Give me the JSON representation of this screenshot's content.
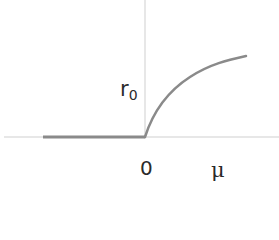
{
  "diagram": {
    "type": "bifurcation-diagram",
    "axes": {
      "x_label": "μ",
      "y_label_main": "r",
      "y_label_sub": "0",
      "origin_label": "0",
      "axis_color": "#c8c8c8"
    },
    "branches": [
      {
        "name": "trivial-branch",
        "description": "r0 = 0 for μ < 0",
        "color": "#8a8a8a"
      },
      {
        "name": "nontrivial-branch",
        "description": "r0 = sqrt-like growth for μ > 0",
        "color": "#8a8a8a"
      }
    ]
  }
}
